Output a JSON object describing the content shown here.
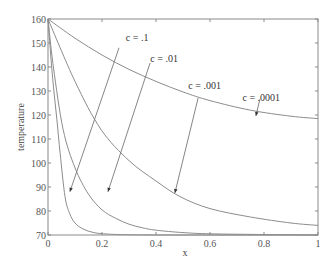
{
  "chart_data": {
    "type": "line",
    "title": "",
    "xlabel": "x",
    "ylabel": "temperature",
    "xlim": [
      0,
      1
    ],
    "ylim": [
      70,
      160
    ],
    "x_ticks": [
      0,
      0.2,
      0.4,
      0.6,
      0.8,
      1
    ],
    "x_tick_labels": [
      "0",
      "0.2",
      "0.4",
      "0.6",
      "0.8",
      "1"
    ],
    "y_ticks": [
      70,
      80,
      90,
      100,
      110,
      120,
      130,
      140,
      150,
      160
    ],
    "y_tick_labels": [
      "70",
      "80",
      "90",
      "100",
      "110",
      "120",
      "130",
      "140",
      "150",
      "160"
    ],
    "grid": false,
    "legend": "none",
    "series": [
      {
        "name": "c = .1",
        "x": [
          0,
          0.01,
          0.02,
          0.033,
          0.045,
          0.063,
          0.08,
          0.1,
          0.13,
          0.17,
          0.22,
          0.3,
          0.5,
          1.0
        ],
        "y": [
          160,
          145,
          132,
          118,
          104,
          86,
          79,
          75,
          72.5,
          71,
          70.4,
          70.1,
          70,
          70
        ]
      },
      {
        "name": "c = .01",
        "x": [
          0,
          0.02,
          0.056,
          0.1,
          0.15,
          0.2,
          0.25,
          0.3,
          0.35,
          0.4,
          0.5,
          0.6,
          0.8,
          1.0
        ],
        "y": [
          160,
          140,
          114,
          98,
          87,
          80.5,
          77,
          74.5,
          73,
          72,
          71,
          70.5,
          70.2,
          70
        ]
      },
      {
        "name": "c = .001",
        "x": [
          0,
          0.1,
          0.196,
          0.3,
          0.4,
          0.489,
          0.6,
          0.75,
          0.9,
          1.0
        ],
        "y": [
          160,
          134,
          114,
          101,
          92.5,
          86,
          81,
          77.5,
          75,
          74
        ]
      },
      {
        "name": "c = .0001",
        "x": [
          0,
          0.1,
          0.2,
          0.3,
          0.4,
          0.5,
          0.6,
          0.75,
          0.9,
          1.0
        ],
        "y": [
          160,
          152,
          145,
          139,
          134,
          129.6,
          126,
          122,
          119.5,
          118.5
        ]
      }
    ],
    "annotations": [
      {
        "text": "c = .1",
        "label_at": [
          0.33,
          151
        ],
        "arrow_from": [
          0.263,
          148
        ],
        "arrow_to": [
          0.081,
          88
        ]
      },
      {
        "text": "c = .01",
        "label_at": [
          0.43,
          142
        ],
        "arrow_from": [
          0.378,
          141.7
        ],
        "arrow_to": [
          0.222,
          88
        ]
      },
      {
        "text": "c = .001",
        "label_at": [
          0.58,
          131
        ],
        "arrow_from": [
          0.556,
          127.1
        ],
        "arrow_to": [
          0.47,
          87.5
        ]
      },
      {
        "text": "c = .0001",
        "label_at": [
          0.79,
          126
        ],
        "arrow_from": [
          0.785,
          126.7
        ],
        "arrow_to": [
          0.77,
          119.6
        ]
      }
    ]
  }
}
